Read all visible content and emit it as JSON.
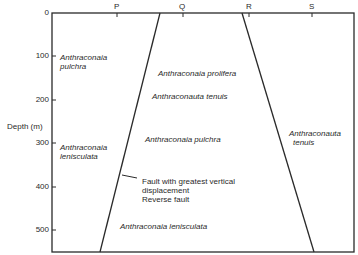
{
  "axis": {
    "y_label": "Depth (m)",
    "y_ticks": [
      {
        "label": "0",
        "y": 13
      },
      {
        "label": "100",
        "y": 56
      },
      {
        "label": "200",
        "y": 100
      },
      {
        "label": "300",
        "y": 143
      },
      {
        "label": "400",
        "y": 187
      },
      {
        "label": "500",
        "y": 230
      }
    ],
    "top_markers": [
      {
        "label": "P",
        "x": 117
      },
      {
        "label": "Q",
        "x": 183
      },
      {
        "label": "R",
        "x": 249
      },
      {
        "label": "S",
        "x": 312
      }
    ]
  },
  "labels": {
    "left_upper_1": "Anthraconaia",
    "left_upper_2": "pulchra",
    "left_lower_1": "Anthraconaia",
    "left_lower_2": "lenisculata",
    "middle_1": "Anthraconaia prolifera",
    "middle_2": "Anthraconauta tenuis",
    "middle_3": "Anthraconaia pulchra",
    "middle_4": "Anthraconaia lenisculata",
    "right_1": "Anthraconauta",
    "right_2": "tenuis",
    "fault_note_1": "Fault with greatest vertical",
    "fault_note_2": "displacement",
    "fault_note_3": "Reverse fault"
  },
  "colors": {
    "line": "#2a2a2a",
    "background": "#ffffff"
  }
}
